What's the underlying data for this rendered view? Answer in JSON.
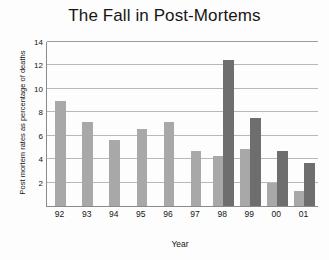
{
  "chart_data": {
    "type": "bar",
    "title": "The Fall in Post-Mortems",
    "xlabel": "Year",
    "ylabel": "Post mortem rates as percentage of deaths",
    "categories": [
      "92",
      "93",
      "94",
      "95",
      "96",
      "97",
      "98",
      "99",
      "00",
      "01"
    ],
    "ylim": [
      0,
      14
    ],
    "yticks": [
      0,
      2,
      4,
      6,
      8,
      10,
      12,
      14
    ],
    "ytick_labels": [
      "0",
      "2",
      "4",
      "6",
      "8",
      "10",
      "12",
      "14"
    ],
    "grid": true,
    "legend": "none",
    "series": [
      {
        "name": "light-grey-series",
        "color": "#a8a8a8",
        "values": [
          9.0,
          7.2,
          5.6,
          6.6,
          7.2,
          4.7,
          4.3,
          4.9,
          2.0,
          1.3
        ]
      },
      {
        "name": "dark-grey-series",
        "color": "#6e6e6e",
        "values": [
          null,
          null,
          null,
          null,
          null,
          null,
          12.5,
          7.5,
          4.7,
          3.7
        ]
      }
    ]
  }
}
